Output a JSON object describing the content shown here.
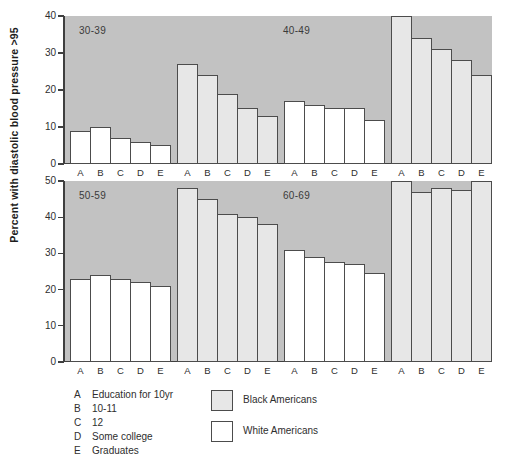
{
  "ylabel": "Percent with diastolic blood pressure >95",
  "colors": {
    "panel_bg": "#c2c2c2",
    "black_americans_fill": "#e7e7e7",
    "white_americans_fill": "#ffffff",
    "outline": "#4c4c4c",
    "text": "#2e2e2e"
  },
  "legend": {
    "education_key": [
      {
        "letter": "A",
        "label": "Education for 10yr"
      },
      {
        "letter": "B",
        "label": "10-11"
      },
      {
        "letter": "C",
        "label": "12"
      },
      {
        "letter": "D",
        "label": "Some college"
      },
      {
        "letter": "E",
        "label": "Graduates"
      }
    ],
    "series_key": [
      {
        "label": "Black Americans",
        "swatch": "gray"
      },
      {
        "label": "White Americans",
        "swatch": "white"
      }
    ]
  },
  "chart_data": {
    "type": "bar",
    "categories": [
      "A",
      "B",
      "C",
      "D",
      "E"
    ],
    "ylabel": "Percent with diastolic blood pressure >95",
    "grid": false,
    "panels": [
      {
        "ylim": [
          0,
          40
        ],
        "yticks": [
          40,
          30,
          20,
          10,
          0
        ],
        "age_labels": [
          "30-39",
          "40-49"
        ],
        "groups": [
          {
            "age": "30-39",
            "series": "White Americans",
            "fill": "white",
            "values": [
              9,
              10,
              7,
              6,
              5
            ]
          },
          {
            "age": "30-39",
            "series": "Black Americans",
            "fill": "gray",
            "values": [
              27,
              24,
              19,
              15,
              13
            ]
          },
          {
            "age": "40-49",
            "series": "White Americans",
            "fill": "white",
            "values": [
              17,
              16,
              15,
              15,
              12
            ]
          },
          {
            "age": "40-49",
            "series": "Black Americans",
            "fill": "gray",
            "values": [
              40,
              34,
              31,
              28,
              24
            ]
          }
        ]
      },
      {
        "ylim": [
          0,
          50
        ],
        "yticks": [
          50,
          40,
          30,
          20,
          10,
          0
        ],
        "age_labels": [
          "50-59",
          "60-69"
        ],
        "groups": [
          {
            "age": "50-59",
            "series": "White Americans",
            "fill": "white",
            "values": [
              23,
              24,
              23,
              22,
              21
            ]
          },
          {
            "age": "50-59",
            "series": "Black Americans",
            "fill": "gray",
            "values": [
              48,
              45,
              41,
              40,
              38
            ]
          },
          {
            "age": "60-69",
            "series": "White Americans",
            "fill": "white",
            "values": [
              31,
              29,
              27.5,
              27,
              24.5
            ]
          },
          {
            "age": "60-69",
            "series": "Black Americans",
            "fill": "gray",
            "values": [
              50,
              47,
              48,
              47.5,
              50
            ]
          }
        ]
      }
    ]
  }
}
